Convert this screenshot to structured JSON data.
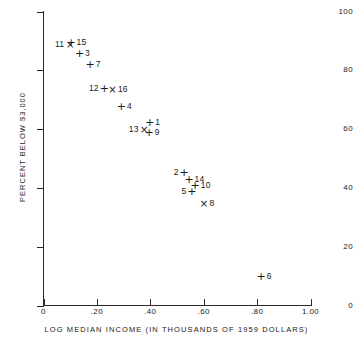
{
  "chart_data": {
    "type": "scatter",
    "title": "",
    "xlabel": "LOG MEDIAN INCOME (IN THOUSANDS OF 1959 DOLLARS)",
    "ylabel": "PERCENT BELOW $3,000",
    "xlim": [
      0,
      1.0
    ],
    "ylim": [
      0,
      100
    ],
    "xticks": [
      "0",
      ".20",
      ".40",
      ".60",
      ".80",
      "1.00"
    ],
    "xtick_values": [
      0,
      0.2,
      0.4,
      0.6,
      0.8,
      1.0
    ],
    "yticks": [
      "0",
      "20",
      "40",
      "60",
      "80",
      "100"
    ],
    "ytick_values": [
      0,
      20,
      40,
      60,
      80,
      100
    ],
    "grid": false,
    "legend": "none",
    "marker_types": [
      "plus",
      "cross"
    ],
    "points": [
      {
        "label": "11",
        "marker": "cross",
        "x": 0.1,
        "y": 89.0,
        "label_pos": "left"
      },
      {
        "label": "15",
        "marker": "plus",
        "x": 0.103,
        "y": 89.5,
        "label_pos": "right"
      },
      {
        "label": "3",
        "marker": "plus",
        "x": 0.135,
        "y": 86.0,
        "label_pos": "right"
      },
      {
        "label": "7",
        "marker": "plus",
        "x": 0.175,
        "y": 82.0,
        "label_pos": "right"
      },
      {
        "label": "12",
        "marker": "plus",
        "x": 0.228,
        "y": 74.0,
        "label_pos": "left"
      },
      {
        "label": "16",
        "marker": "cross",
        "x": 0.258,
        "y": 73.5,
        "label_pos": "right"
      },
      {
        "label": "4",
        "marker": "plus",
        "x": 0.292,
        "y": 68.0,
        "label_pos": "right"
      },
      {
        "label": "13",
        "marker": "cross",
        "x": 0.377,
        "y": 60.0,
        "label_pos": "left"
      },
      {
        "label": "1",
        "marker": "plus",
        "x": 0.398,
        "y": 62.5,
        "label_pos": "right"
      },
      {
        "label": "9",
        "marker": "plus",
        "x": 0.396,
        "y": 59.0,
        "label_pos": "right"
      },
      {
        "label": "2",
        "marker": "plus",
        "x": 0.527,
        "y": 45.5,
        "label_pos": "left"
      },
      {
        "label": "14",
        "marker": "plus",
        "x": 0.545,
        "y": 43.0,
        "label_pos": "right"
      },
      {
        "label": "10",
        "marker": "plus",
        "x": 0.568,
        "y": 41.0,
        "label_pos": "right"
      },
      {
        "label": "5",
        "marker": "plus",
        "x": 0.556,
        "y": 39.0,
        "label_pos": "left"
      },
      {
        "label": "8",
        "marker": "cross",
        "x": 0.601,
        "y": 35.0,
        "label_pos": "right"
      },
      {
        "label": "6",
        "marker": "plus",
        "x": 0.815,
        "y": 10.0,
        "label_pos": "right"
      }
    ]
  },
  "colors": {
    "axis": "#2a2a2a",
    "text": "#1a1a1a",
    "background": "#ffffff"
  }
}
